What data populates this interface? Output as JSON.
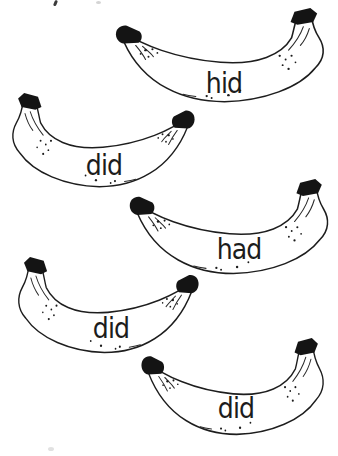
{
  "document": {
    "kind": "banana word cards worksheet",
    "colors": {
      "ink": "#1d1d1d",
      "background": "#ffffff"
    }
  },
  "bananas": [
    {
      "label": "hid"
    },
    {
      "label": "did"
    },
    {
      "label": "had"
    },
    {
      "label": "did"
    },
    {
      "label": "did"
    }
  ]
}
